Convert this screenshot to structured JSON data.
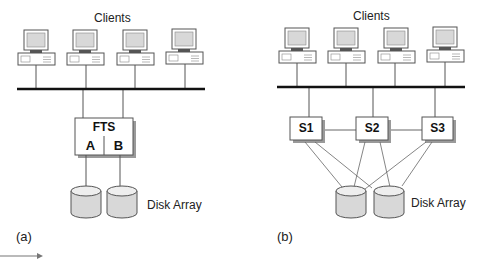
{
  "panel_a": {
    "clients_label": "Clients",
    "server_label": "FTS",
    "server_parts": [
      "A",
      "B"
    ],
    "storage_label": "Disk Array",
    "caption": "(a)"
  },
  "panel_b": {
    "clients_label": "Clients",
    "servers": [
      "S1",
      "S2",
      "S3"
    ],
    "storage_label": "Disk Array",
    "caption": "(b)"
  },
  "colors": {
    "line": "#444444",
    "bus": "#111111",
    "fill": "#d8d8d8",
    "box_shadow": "#9a9a9a"
  }
}
